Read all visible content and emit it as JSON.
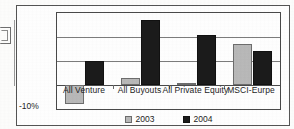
{
  "chart_data": {
    "type": "bar",
    "title": "",
    "xlabel": "",
    "ylabel": "",
    "categories": [
      "All Venture",
      "All Buyouts",
      "All Private Equity",
      "MSCI-Eurpe"
    ],
    "series": [
      {
        "name": "2003",
        "color": "#b9b9b9",
        "values": [
          -8,
          3,
          1,
          17
        ]
      },
      {
        "name": "2004",
        "color": "#1b1b1b",
        "values": [
          10,
          27,
          21,
          14
        ]
      }
    ],
    "ylim": [
      -10,
      30
    ],
    "yticks": [
      -10,
      0,
      10,
      20,
      30
    ],
    "ytick_labels_visible": [
      "-10%"
    ],
    "grid": true,
    "legend_position": "bottom"
  },
  "axis": {
    "bottom_label": "-10%"
  },
  "legend": {
    "items": [
      {
        "label": "2003"
      },
      {
        "label": "2004"
      }
    ]
  },
  "marks": {
    "edge_glyph": "page-edge-marker-icon"
  }
}
